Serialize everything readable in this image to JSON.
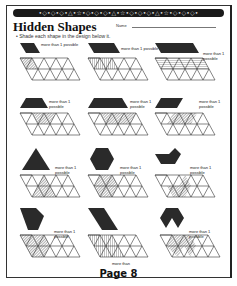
{
  "header": {
    "border_pattern": "•◇•◇•◇•△•☆•◇•◇•◇•△•☆•◇•◇•◇•△•☆•◇•◇•◇•",
    "title": "Hidden Shapes",
    "name_label": "Name"
  },
  "instruction": "• Shade each shape in the design below it.",
  "note_text": "more than\n1 possible",
  "puzzles": [
    {
      "id": 1,
      "shape": "parallelogram",
      "note": "more than 1 possible"
    },
    {
      "id": 2,
      "shape": "wide-parallelogram",
      "note": "more than 1 possible"
    },
    {
      "id": 3,
      "shape": "long-parallelogram",
      "note": "more than 1 possible"
    },
    {
      "id": 4,
      "shape": "trapezoid",
      "note": "more than 1 possible"
    },
    {
      "id": 5,
      "shape": "wide-trapezoid",
      "note": "more than 1 possible"
    },
    {
      "id": 6,
      "shape": "parallelogram",
      "note": "more than 1 possible"
    },
    {
      "id": 7,
      "shape": "large-triangle",
      "note": "more than 1 possible"
    },
    {
      "id": 8,
      "shape": "hexagon",
      "note": "more than 1 possible"
    },
    {
      "id": 9,
      "shape": "chevron",
      "note": "more than 1 possible"
    },
    {
      "id": 10,
      "shape": "hexagon-pentagon",
      "note": "more than 1 possible"
    },
    {
      "id": 11,
      "shape": "large-rhombus",
      "note": "more than"
    },
    {
      "id": 12,
      "shape": "notched-hexagon",
      "note": "more than 1 possible"
    }
  ],
  "footer": {
    "page_label": "Page 8"
  },
  "colors": {
    "shape_fill": "#2a2a2a",
    "hatch": "#666666",
    "grid_line": "#333333"
  }
}
